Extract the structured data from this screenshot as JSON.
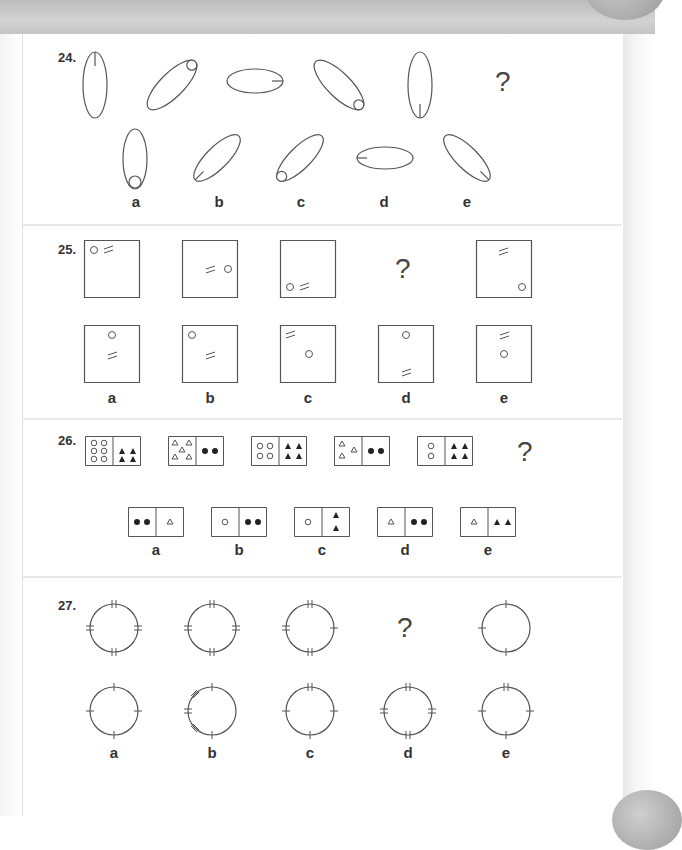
{
  "questions": [
    {
      "number": "24.",
      "sequence_description": [
        "vertical ellipse with line at top",
        "ellipse tilted right with small circle at upper end",
        "horizontal ellipse with line at right end",
        "ellipse tilted left with small circle at lower end",
        "vertical ellipse with line at bottom"
      ],
      "unknown": "?",
      "options": [
        {
          "label": "a",
          "description": "vertical ellipse with small circle at bottom"
        },
        {
          "label": "b",
          "description": "ellipse tilted right with line at lower end"
        },
        {
          "label": "c",
          "description": "ellipse tilted right with small circle at lower end"
        },
        {
          "label": "d",
          "description": "horizontal ellipse with line at left end"
        },
        {
          "label": "e",
          "description": "ellipse tilted left with line at lower end"
        }
      ]
    },
    {
      "number": "25.",
      "sequence_description": [
        "square, circle and double-stroke top-left",
        "square, double-stroke and circle middle-right",
        "square, circle and double-stroke bottom-left"
      ],
      "unknown": "?",
      "last_figure": "square, double-stroke top-center, circle bottom-right",
      "options": [
        {
          "label": "a",
          "description": "circle top-center, double-stroke below"
        },
        {
          "label": "b",
          "description": "circle top-left, double-stroke center"
        },
        {
          "label": "c",
          "description": "double-stroke top-left, circle center"
        },
        {
          "label": "d",
          "description": "circle top-center, double-stroke bottom-center"
        },
        {
          "label": "e",
          "description": "double-stroke top-center, circle below"
        }
      ]
    },
    {
      "number": "26.",
      "sequence_description": [
        "6 open circles | 4 filled triangles",
        "5 open triangles | 2 filled dots",
        "4 open circles | 4 filled triangles",
        "3 open triangles | 2 filled dots",
        "2 open circles | 4 filled triangles"
      ],
      "unknown": "?",
      "options": [
        {
          "label": "a",
          "description": "2 filled dots | 1 open triangle"
        },
        {
          "label": "b",
          "description": "1 open circle | 2 filled dots"
        },
        {
          "label": "c",
          "description": "1 open circle | 2 filled triangles"
        },
        {
          "label": "d",
          "description": "1 open triangle | 2 filled dots"
        },
        {
          "label": "e",
          "description": "1 open triangle | 2 filled triangles"
        }
      ]
    },
    {
      "number": "27.",
      "sequence_description": [
        "circle with 8 marks, all double",
        "circle with some double marks",
        "circle with fewer double marks"
      ],
      "unknown": "?",
      "last_figure": "circle with 6 single marks",
      "options": [
        {
          "label": "a",
          "description": "circle with 8 single marks"
        },
        {
          "label": "b",
          "description": "circle with left-side marks only"
        },
        {
          "label": "c",
          "description": "circle with top double mark"
        },
        {
          "label": "d",
          "description": "circle with 8 double marks"
        },
        {
          "label": "e",
          "description": "circle with top double mark, single others"
        }
      ]
    }
  ],
  "labels": {
    "q24": "24.",
    "q25": "25.",
    "q26": "26.",
    "q27": "27.",
    "qmark": "?",
    "a": "a",
    "b": "b",
    "c": "c",
    "d": "d",
    "e": "e"
  }
}
